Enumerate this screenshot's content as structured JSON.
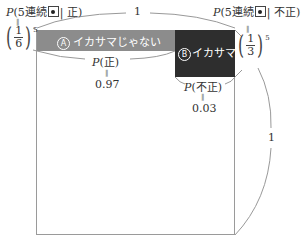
{
  "diagram": {
    "top_width_label": "1",
    "right_height_label": "1",
    "left_formula": {
      "prefix": "P",
      "args_open": "(5連続",
      "args_close": "| 正)",
      "equals": "‖",
      "fraction_num": "1",
      "fraction_den": "6",
      "exponent": "5"
    },
    "right_formula": {
      "prefix": "P",
      "args_open": "(5連続",
      "args_close": "| 不正)",
      "equals": "‖",
      "fraction_num": "1",
      "fraction_den": "3",
      "exponent": "5"
    },
    "region_a": {
      "marker": "A",
      "label": "イカサマじゃない",
      "color": "#8c8c8c"
    },
    "region_b": {
      "marker": "B",
      "label": "イカサマ!",
      "color": "#2e2e2e"
    },
    "prob_fair": {
      "prefix": "P",
      "arg": "(正)",
      "equals": "‖",
      "value": "0.97"
    },
    "prob_unfair": {
      "prefix": "P",
      "arg": "(不正)",
      "equals": "‖",
      "value": "0.03"
    },
    "dice_icon": "dice-one-pip-icon"
  }
}
